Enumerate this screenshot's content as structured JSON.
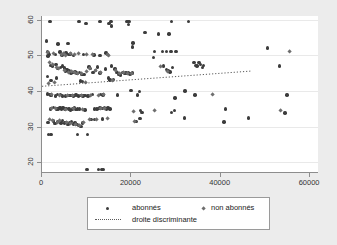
{
  "chart_data": {
    "type": "scatter",
    "title": "",
    "subtitle": "",
    "xlabel": "",
    "ylabel": "",
    "xlim": [
      0,
      62000
    ],
    "ylim": [
      17,
      61
    ],
    "xticks": [
      0,
      20000,
      40000,
      60000
    ],
    "xtick_labels": [
      "0",
      "20000",
      "40000",
      "60000"
    ],
    "yticks": [
      20,
      30,
      40,
      50,
      60
    ],
    "ytick_labels": [
      "20",
      "30",
      "40",
      "50",
      "60"
    ],
    "grid": true,
    "grid_axis": "y",
    "legend_position": "below",
    "colors": {
      "abonnes": "#3c3c3c",
      "non_abonnes": "#6e6e6e",
      "line": "#5a5a5a",
      "panel_background": "#ffffff",
      "figure_background": "#ececec",
      "axis": "#8d8d8d",
      "gridline": "#e9e9e9"
    },
    "series": [
      {
        "name": "abonnés",
        "marker": "circle",
        "color": "#3c3c3c",
        "points": [
          [
            1800,
            59.5
          ],
          [
            8300,
            59.4
          ],
          [
            9800,
            58.9
          ],
          [
            13000,
            59.4
          ],
          [
            15000,
            58.9
          ],
          [
            15400,
            59.5
          ],
          [
            15500,
            58.2
          ],
          [
            19000,
            59.5
          ],
          [
            19300,
            58.6
          ],
          [
            19500,
            59.4
          ],
          [
            29000,
            59.4
          ],
          [
            32800,
            59.4
          ],
          [
            1000,
            54.0
          ],
          [
            3600,
            53.2
          ],
          [
            5800,
            53.3
          ],
          [
            20400,
            53.4
          ],
          [
            23000,
            56.4
          ],
          [
            26100,
            56.0
          ],
          [
            28400,
            56.0
          ],
          [
            1200,
            51.0
          ],
          [
            1300,
            49.8
          ],
          [
            1500,
            50.6
          ],
          [
            1600,
            50.2
          ],
          [
            3000,
            50.3
          ],
          [
            4000,
            50.9
          ],
          [
            4500,
            50.1
          ],
          [
            5400,
            50.6
          ],
          [
            6000,
            50.2
          ],
          [
            6400,
            50.4
          ],
          [
            7000,
            50.0
          ],
          [
            9300,
            50.3
          ],
          [
            11600,
            50.1
          ],
          [
            13000,
            49.9
          ],
          [
            14300,
            50.6
          ],
          [
            14600,
            50.2
          ],
          [
            20300,
            52.3
          ],
          [
            25200,
            51.0
          ],
          [
            26900,
            51.0
          ],
          [
            27900,
            51.0
          ],
          [
            28900,
            51.0
          ],
          [
            30000,
            51.0
          ],
          [
            50400,
            52.0
          ],
          [
            1900,
            47.2
          ],
          [
            2300,
            47.0
          ],
          [
            3100,
            47.4
          ],
          [
            3400,
            46.3
          ],
          [
            4100,
            46.6
          ],
          [
            4600,
            47.0
          ],
          [
            5000,
            46.4
          ],
          [
            5300,
            45.6
          ],
          [
            5600,
            46.0
          ],
          [
            6000,
            45.6
          ],
          [
            6200,
            45.2
          ],
          [
            6500,
            45.0
          ],
          [
            7000,
            45.2
          ],
          [
            7400,
            45.3
          ],
          [
            7700,
            45.0
          ],
          [
            8000,
            44.9
          ],
          [
            8400,
            45.2
          ],
          [
            8900,
            44.6
          ],
          [
            9400,
            44.7
          ],
          [
            10500,
            46.7
          ],
          [
            10900,
            46.3
          ],
          [
            11400,
            45.1
          ],
          [
            12000,
            45.8
          ],
          [
            12400,
            46.7
          ],
          [
            13000,
            45.0
          ],
          [
            14200,
            46.2
          ],
          [
            15500,
            47.0
          ],
          [
            16300,
            46.2
          ],
          [
            16800,
            45.1
          ],
          [
            17200,
            44.6
          ],
          [
            17600,
            44.5
          ],
          [
            18000,
            45.1
          ],
          [
            18400,
            44.9
          ],
          [
            18800,
            45.0
          ],
          [
            19300,
            45.0
          ],
          [
            19700,
            44.8
          ],
          [
            20200,
            45.0
          ],
          [
            25000,
            49.3
          ],
          [
            27200,
            47.0
          ],
          [
            27800,
            46.0
          ],
          [
            28200,
            45.8
          ],
          [
            28600,
            45.3
          ],
          [
            29200,
            46.6
          ],
          [
            34000,
            48.0
          ],
          [
            34300,
            47.2
          ],
          [
            34700,
            47.0
          ],
          [
            35100,
            48.0
          ],
          [
            35400,
            47.4
          ],
          [
            35900,
            46.6
          ],
          [
            36100,
            47.2
          ],
          [
            53200,
            47.0
          ],
          [
            1200,
            44.0
          ],
          [
            2000,
            43.0
          ],
          [
            3200,
            43.6
          ],
          [
            8600,
            42.8
          ],
          [
            9000,
            42.6
          ],
          [
            14900,
            43.6
          ],
          [
            15200,
            43.1
          ],
          [
            16000,
            43.3
          ],
          [
            19900,
            40.2
          ],
          [
            21800,
            39.9
          ],
          [
            32000,
            40.0
          ],
          [
            1200,
            39.2
          ],
          [
            1800,
            39.0
          ],
          [
            2000,
            38.7
          ],
          [
            3000,
            38.6
          ],
          [
            3500,
            39.0
          ],
          [
            4100,
            39.0
          ],
          [
            4600,
            38.6
          ],
          [
            5300,
            38.6
          ],
          [
            6000,
            38.7
          ],
          [
            6500,
            38.8
          ],
          [
            7000,
            38.6
          ],
          [
            7600,
            38.9
          ],
          [
            8200,
            38.6
          ],
          [
            8600,
            38.8
          ],
          [
            9200,
            38.6
          ],
          [
            9600,
            38.7
          ],
          [
            10300,
            38.6
          ],
          [
            11300,
            39.0
          ],
          [
            13100,
            39.0
          ],
          [
            13600,
            38.9
          ],
          [
            16900,
            38.9
          ],
          [
            21400,
            38.9
          ],
          [
            29800,
            38.0
          ],
          [
            34200,
            38.9
          ],
          [
            54800,
            38.9
          ],
          [
            1900,
            35.0
          ],
          [
            2600,
            35.4
          ],
          [
            3200,
            34.9
          ],
          [
            3600,
            35.0
          ],
          [
            4000,
            35.3
          ],
          [
            4300,
            34.9
          ],
          [
            4700,
            35.3
          ],
          [
            5100,
            35.0
          ],
          [
            5500,
            35.1
          ],
          [
            6000,
            35.0
          ],
          [
            6400,
            34.6
          ],
          [
            6800,
            35.0
          ],
          [
            7200,
            35.2
          ],
          [
            7600,
            34.8
          ],
          [
            8000,
            35.0
          ],
          [
            8400,
            34.9
          ],
          [
            9600,
            34.7
          ],
          [
            11800,
            35.0
          ],
          [
            12300,
            34.9
          ],
          [
            13000,
            35.2
          ],
          [
            13500,
            35.1
          ],
          [
            14000,
            35.3
          ],
          [
            14400,
            34.9
          ],
          [
            14800,
            35.2
          ],
          [
            15200,
            34.9
          ],
          [
            22000,
            34.5
          ],
          [
            29700,
            34.5
          ],
          [
            41000,
            35.0
          ],
          [
            1300,
            31.2
          ],
          [
            2600,
            31.6
          ],
          [
            2900,
            30.9
          ],
          [
            3500,
            31.5
          ],
          [
            4200,
            31.0
          ],
          [
            4600,
            31.8
          ],
          [
            5000,
            31.0
          ],
          [
            5400,
            31.2
          ],
          [
            5800,
            30.6
          ],
          [
            6200,
            31.0
          ],
          [
            6600,
            31.4
          ],
          [
            7000,
            30.8
          ],
          [
            7400,
            31.0
          ],
          [
            7800,
            30.6
          ],
          [
            8200,
            30.3
          ],
          [
            8700,
            30.0
          ],
          [
            9100,
            31.0
          ],
          [
            11000,
            32.0
          ],
          [
            11700,
            32.0
          ],
          [
            13500,
            32.2
          ],
          [
            21000,
            31.4
          ],
          [
            21900,
            32.3
          ],
          [
            31900,
            32.4
          ],
          [
            40700,
            31.3
          ],
          [
            46200,
            32.4
          ],
          [
            54400,
            33.8
          ],
          [
            22400,
            34.0
          ],
          [
            29000,
            34.0
          ],
          [
            1400,
            27.8
          ],
          [
            2000,
            27.8
          ],
          [
            7900,
            27.8
          ],
          [
            10200,
            27.8
          ],
          [
            10100,
            18.0
          ],
          [
            12700,
            18.0
          ],
          [
            13300,
            18.0
          ],
          [
            13600,
            18.0
          ]
        ]
      },
      {
        "name": "non abonnés",
        "marker": "diamond",
        "color": "#6e6e6e",
        "points": [
          [
            1300,
            50.8
          ],
          [
            2600,
            50.6
          ],
          [
            4300,
            50.3
          ],
          [
            4900,
            50.5
          ],
          [
            5200,
            50.0
          ],
          [
            6500,
            50.4
          ],
          [
            7200,
            50.2
          ],
          [
            8200,
            50.6
          ],
          [
            9900,
            50.3
          ],
          [
            11300,
            50.3
          ],
          [
            14700,
            50.2
          ],
          [
            15000,
            49.9
          ],
          [
            1700,
            48.0
          ],
          [
            2400,
            47.3
          ],
          [
            3300,
            46.6
          ],
          [
            3800,
            46.3
          ],
          [
            5100,
            45.8
          ],
          [
            5900,
            45.2
          ],
          [
            6700,
            45.4
          ],
          [
            7300,
            45.1
          ],
          [
            7900,
            44.8
          ],
          [
            8800,
            45.0
          ],
          [
            10000,
            45.3
          ],
          [
            10700,
            46.4
          ],
          [
            11900,
            45.6
          ],
          [
            13200,
            45.2
          ],
          [
            16500,
            45.6
          ],
          [
            17400,
            45.0
          ],
          [
            18200,
            45.2
          ],
          [
            19100,
            44.8
          ],
          [
            20000,
            44.9
          ],
          [
            26600,
            46.8
          ],
          [
            28000,
            45.4
          ],
          [
            55300,
            51.0
          ],
          [
            1500,
            42.0
          ],
          [
            2700,
            42.3
          ],
          [
            9700,
            42.3
          ],
          [
            15700,
            43.0
          ],
          [
            2200,
            39.0
          ],
          [
            3900,
            38.8
          ],
          [
            5700,
            38.6
          ],
          [
            6900,
            38.8
          ],
          [
            8800,
            38.7
          ],
          [
            10800,
            38.8
          ],
          [
            12600,
            38.7
          ],
          [
            13800,
            38.9
          ],
          [
            38200,
            38.9
          ],
          [
            2200,
            35.2
          ],
          [
            3000,
            35.1
          ],
          [
            5200,
            34.8
          ],
          [
            7000,
            35.0
          ],
          [
            9000,
            34.9
          ],
          [
            13200,
            35.2
          ],
          [
            14100,
            35.0
          ],
          [
            20500,
            34.2
          ],
          [
            25300,
            34.5
          ],
          [
            53500,
            34.4
          ],
          [
            1800,
            32.0
          ],
          [
            2400,
            31.8
          ],
          [
            3400,
            31.2
          ],
          [
            4000,
            31.6
          ],
          [
            5600,
            31.0
          ],
          [
            6300,
            30.9
          ],
          [
            7600,
            30.5
          ],
          [
            8500,
            30.2
          ],
          [
            9400,
            31.1
          ],
          [
            10600,
            32.0
          ],
          [
            12100,
            32.0
          ],
          [
            14700,
            32.3
          ],
          [
            20700,
            31.5
          ]
        ]
      }
    ],
    "trend_line": {
      "name": "droite discriminante",
      "style": "dotted",
      "color": "#5a5a5a",
      "x_start": 0,
      "x_end": 47000,
      "y_start": 41.3,
      "y_end": 45.6
    }
  },
  "legend": {
    "entries": [
      {
        "label": "abonnés",
        "marker": "circle"
      },
      {
        "label": "non abonnés",
        "marker": "diamond"
      },
      {
        "label": "droite discriminante",
        "marker": "dotted-line"
      }
    ]
  }
}
